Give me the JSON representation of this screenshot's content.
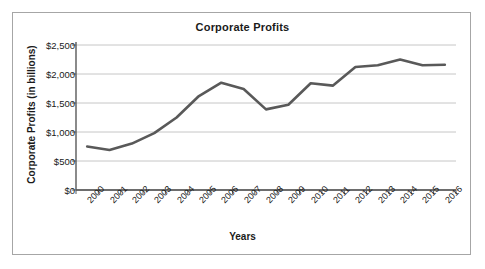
{
  "chart_data": {
    "type": "line",
    "title": "Corporate Profits",
    "xlabel": "Years",
    "ylabel": "Corporate Profits (in billions)",
    "categories": [
      "2000",
      "2001",
      "2002",
      "2003",
      "2004",
      "2005",
      "2006",
      "2007",
      "2008",
      "2009",
      "2010",
      "2011",
      "2012",
      "2013",
      "2014",
      "2015",
      "2016"
    ],
    "values": [
      750,
      690,
      800,
      980,
      1250,
      1620,
      1850,
      1740,
      1390,
      1470,
      1840,
      1800,
      2120,
      2150,
      2250,
      2150,
      2160
    ],
    "series": [
      {
        "name": "Corporate Profits",
        "values": [
          750,
          690,
          800,
          980,
          1250,
          1620,
          1850,
          1740,
          1390,
          1470,
          1840,
          1800,
          2120,
          2150,
          2250,
          2150,
          2160
        ]
      }
    ],
    "ylim": [
      0,
      2500
    ],
    "ytick_values": [
      0,
      500,
      1000,
      1500,
      2000,
      2500
    ],
    "ytick_labels": [
      "$0",
      "$500",
      "$1,000",
      "$1,500",
      "$2,000",
      "$2,500"
    ],
    "grid": "horizontal",
    "legend": "none",
    "units": "billions of dollars",
    "line_color": "#595959",
    "grid_color": "#bfbfbf",
    "axis_color": "#595959",
    "background_color": "#ffffff",
    "border_color": "#a6a6a6"
  }
}
